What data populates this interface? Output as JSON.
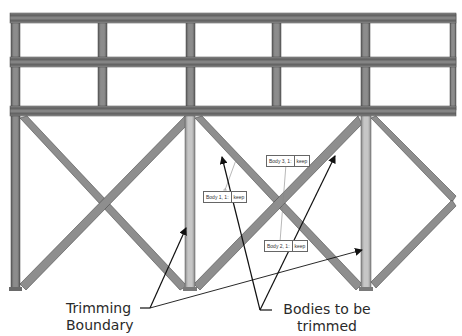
{
  "figure": {
    "colors": {
      "beam": "#8a8a8a",
      "beam_dark": "#5a5a5a",
      "beam_light": "#b4b4b4",
      "column_highlight": "#c8c8c8",
      "arrow": "#111111",
      "background": "#ffffff"
    }
  },
  "body_labels": [
    {
      "name": "Body 1, 1:",
      "action": "keep"
    },
    {
      "name": "Body 3, 1:",
      "action": "keep"
    },
    {
      "name": "Body 2, 1:",
      "action": "keep"
    }
  ],
  "callouts": {
    "trimming_boundary": {
      "line1": "Trimming",
      "line2": "Boundary"
    },
    "bodies_to_be_trimmed": {
      "line1": "Bodies to be",
      "line2": "trimmed"
    }
  }
}
